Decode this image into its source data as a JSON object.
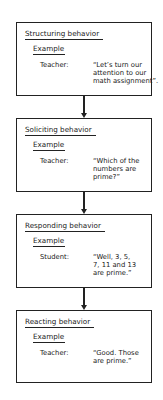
{
  "diagram": {
    "type": "vertical-flowchart",
    "boxes": [
      {
        "title": "Structuring behavior",
        "example_label": "Example",
        "speaker": "Teacher:",
        "quote_lines": [
          "“Let’s turn our",
          "attention to our",
          "math assignment”."
        ]
      },
      {
        "title": "Soliciting behavior",
        "example_label": "Example",
        "speaker": "Teacher:",
        "quote_lines": [
          "“Which of the",
          "numbers are",
          "prime?”"
        ]
      },
      {
        "title": "Responding behavior",
        "example_label": "Example",
        "speaker": "Student:",
        "quote_lines": [
          "“Well, 3, 5,",
          "7, 11 and 13",
          "are prime.”"
        ]
      },
      {
        "title": "Reacting behavior",
        "example_label": "Example",
        "speaker": "Teacher:",
        "quote_lines": [
          "“Good. Those",
          "are prime.”"
        ]
      }
    ],
    "edges": [
      {
        "from": "Structuring behavior",
        "to": "Soliciting behavior"
      },
      {
        "from": "Soliciting behavior",
        "to": "Responding behavior"
      },
      {
        "from": "Responding behavior",
        "to": "Reacting behavior"
      }
    ]
  }
}
